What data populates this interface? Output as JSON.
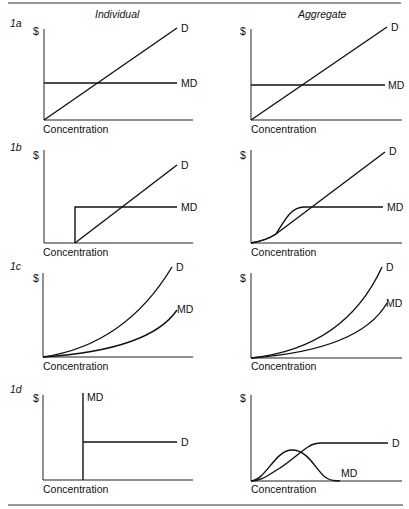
{
  "headers": {
    "left": "Individual",
    "right": "Aggregate"
  },
  "axes": {
    "y_label": "$",
    "x_label": "Concentration"
  },
  "panels": [
    {
      "id": "1a",
      "label": "1a",
      "individual": {
        "curves": [
          "D",
          "MD"
        ],
        "d_label": "D",
        "md_label": "MD"
      },
      "aggregate": {
        "curves": [
          "D",
          "MD"
        ],
        "d_label": "D",
        "md_label": "MD"
      }
    },
    {
      "id": "1b",
      "label": "1b",
      "individual": {
        "curves": [
          "D",
          "MD"
        ],
        "d_label": "D",
        "md_label": "MD"
      },
      "aggregate": {
        "curves": [
          "D",
          "MD"
        ],
        "d_label": "D",
        "md_label": "MD"
      }
    },
    {
      "id": "1c",
      "label": "1c",
      "individual": {
        "curves": [
          "D",
          "MD"
        ],
        "d_label": "D",
        "md_label": "MD"
      },
      "aggregate": {
        "curves": [
          "D",
          "MD"
        ],
        "d_label": "D",
        "md_label": "MD"
      }
    },
    {
      "id": "1d",
      "label": "1d",
      "individual": {
        "curves": [
          "MD",
          "D"
        ],
        "d_label": "D",
        "md_label": "MD"
      },
      "aggregate": {
        "curves": [
          "D",
          "MD"
        ],
        "d_label": "D",
        "md_label": "MD"
      }
    }
  ],
  "colors": {
    "ink": "#111111",
    "background": "#ffffff"
  }
}
